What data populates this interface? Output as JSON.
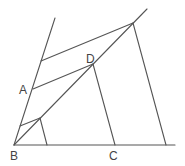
{
  "diagram": {
    "title": "",
    "stroke_color": "#555555",
    "points": {
      "A": {
        "label": "A",
        "x": 33,
        "y": 89,
        "lx": 19,
        "ly": 94
      },
      "B": {
        "label": "B",
        "x": 14,
        "y": 145,
        "lx": 10,
        "ly": 160
      },
      "C": {
        "label": "C",
        "x": 115,
        "y": 145,
        "lx": 109,
        "ly": 160
      },
      "D": {
        "label": "D",
        "x": 93,
        "y": 64,
        "lx": 86,
        "ly": 63
      }
    },
    "segments": [
      {
        "name": "baseline",
        "x1": 14,
        "y1": 145,
        "x2": 175,
        "y2": 145
      },
      {
        "name": "left-ray",
        "x1": 14,
        "y1": 145,
        "x2": 55,
        "y2": 18
      },
      {
        "name": "diagonal-ray",
        "x1": 14,
        "y1": 145,
        "x2": 147,
        "y2": 9
      },
      {
        "name": "top-parallel",
        "x1": 41,
        "y1": 61,
        "x2": 133,
        "y2": 23
      },
      {
        "name": "segment-AD",
        "x1": 33,
        "y1": 89,
        "x2": 93,
        "y2": 64
      },
      {
        "name": "segment-DC",
        "x1": 93,
        "y1": 64,
        "x2": 115,
        "y2": 145
      },
      {
        "name": "top-vertical",
        "x1": 133,
        "y1": 23,
        "x2": 166,
        "y2": 145
      },
      {
        "name": "small-parallel",
        "x1": 20,
        "y1": 126,
        "x2": 40,
        "y2": 118
      },
      {
        "name": "small-vertical",
        "x1": 40,
        "y1": 118,
        "x2": 47,
        "y2": 145
      }
    ]
  }
}
